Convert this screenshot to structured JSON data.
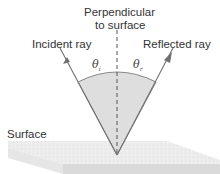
{
  "labels": {
    "normal_line1": "Perpendicular",
    "normal_line2": "to surface",
    "incident": "Incident ray",
    "reflected": "Reflected ray",
    "surface": "Surface",
    "theta_i_symbol": "θ",
    "theta_i_sub": "i",
    "theta_r_symbol": "θ",
    "theta_r_sub": "r"
  },
  "colors": {
    "ray": "#6b6b6b",
    "wedge_fill": "#d9d9d9",
    "slab_top": "#ececec",
    "slab_front": "#dcdcdc",
    "normal": "#555555"
  }
}
